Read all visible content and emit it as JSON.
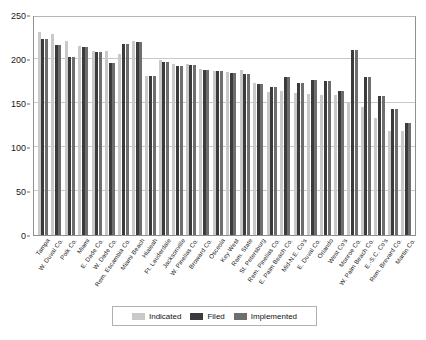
{
  "chart_data": {
    "type": "bar",
    "title": "",
    "subtitle": "",
    "xlabel": "",
    "ylabel": "",
    "ylim": [
      0,
      250
    ],
    "yticks": [
      0,
      50,
      100,
      150,
      200,
      250
    ],
    "grid": true,
    "legend_position": "bottom",
    "categories": [
      "Tampa",
      "W. Duval Co.",
      "Polk Co.",
      "Miami",
      "E. Dade Co.",
      "W. Dade Co.",
      "Rem. Escambia Co.",
      "Miami Beach",
      "Hialeah",
      "Ft. Lauderdale",
      "Jacksonville",
      "W. Pinellas Co.",
      "Broward Co.",
      "Osceola",
      "Key West",
      "Rem. State",
      "St. Petersburg",
      "Rem. Pinellas Co.",
      "E. Palm Beach Co.",
      "Mid-N.E. Co's",
      "E. Duval Co.",
      "Orlando",
      "West Co's",
      "Monroe Co.",
      "W. Palm Beach Co.",
      "E.-S.C. Co's",
      "Rem. Brevard Co.",
      "Martin Co."
    ],
    "series": [
      {
        "name": "Indicated",
        "color": "#c9c9c9",
        "values": [
          231,
          228,
          220,
          215,
          209,
          209,
          206,
          220,
          181,
          199,
          194,
          194,
          189,
          186,
          185,
          188,
          173,
          163,
          164,
          161,
          160,
          159,
          159,
          151,
          145,
          133,
          118,
          118
        ]
      },
      {
        "name": "Filed",
        "color": "#3b3b3b",
        "values": [
          223,
          216,
          202,
          214,
          208,
          195,
          217,
          219,
          181,
          197,
          192,
          193,
          188,
          186,
          184,
          183,
          172,
          168,
          179,
          173,
          176,
          175,
          164,
          210,
          179,
          158,
          143,
          127
        ]
      },
      {
        "name": "Implemented",
        "color": "#6e6e6e",
        "values": [
          223,
          216,
          202,
          214,
          208,
          195,
          217,
          219,
          181,
          197,
          192,
          193,
          188,
          186,
          184,
          183,
          172,
          168,
          179,
          173,
          176,
          175,
          164,
          210,
          179,
          158,
          143,
          127
        ]
      }
    ]
  },
  "legend": {
    "entries": [
      {
        "label": "Indicated"
      },
      {
        "label": "Filed"
      },
      {
        "label": "Implemented"
      }
    ]
  }
}
